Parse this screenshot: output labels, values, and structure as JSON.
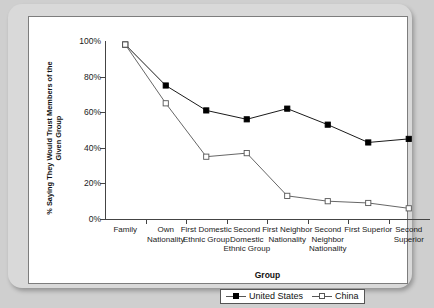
{
  "chart_data": {
    "type": "line",
    "title": "",
    "xlabel": "Group",
    "ylabel": "% Saying They Would Trust Members of the Given Group",
    "categories": [
      "Family",
      "Own Nationality",
      "First Domestic Ethnic Group",
      "Second Domestic Ethnic Group",
      "First Neighbor Nationality",
      "Second Neighbor Nationality",
      "First Superior",
      "Second Superior"
    ],
    "series": [
      {
        "name": "United States",
        "marker": "filled-square",
        "color": "#000000",
        "values": [
          98,
          75,
          61,
          56,
          62,
          53,
          43,
          45
        ]
      },
      {
        "name": "China",
        "marker": "open-square",
        "color": "#555555",
        "values": [
          98,
          65,
          35,
          37,
          13,
          10,
          9,
          6
        ]
      }
    ],
    "ylim": [
      0,
      100
    ],
    "ytick_values": [
      0,
      20,
      40,
      60,
      80,
      100
    ],
    "ytick_labels": [
      "0%",
      "20%",
      "40%",
      "60%",
      "80%",
      "100%"
    ],
    "grid": false,
    "legend_position": "bottom-center"
  },
  "legend": {
    "entries": [
      {
        "label": "United States"
      },
      {
        "label": "China"
      }
    ]
  },
  "axes": {
    "x_title": "Group",
    "y_title": "% Saying They Would Trust Members of the Given Group"
  }
}
